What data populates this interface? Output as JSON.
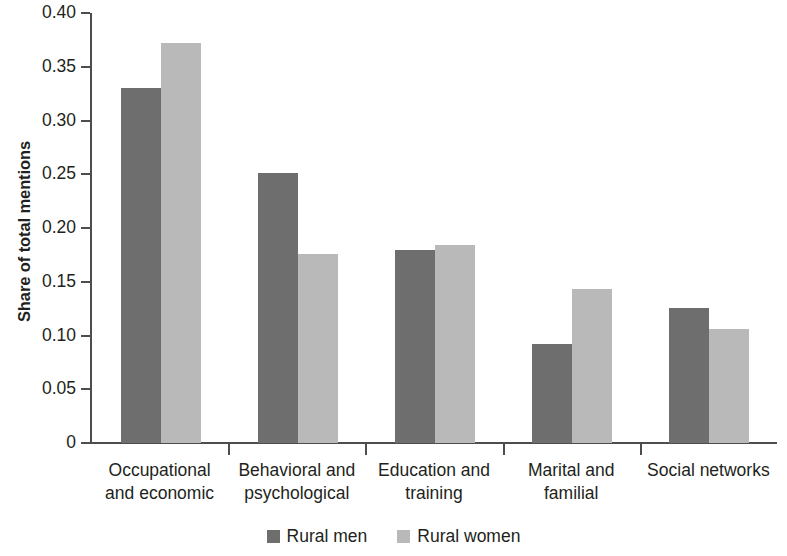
{
  "chart_data": {
    "type": "bar",
    "title": "",
    "xlabel": "",
    "ylabel": "Share of total mentions",
    "ylim": [
      0,
      0.4
    ],
    "grid": false,
    "legend_position": "bottom-center",
    "categories": [
      "Occupational\nand economic",
      "Behavioral and\npsychological",
      "Education and\ntraining",
      "Marital and\nfamilial",
      "Social networks"
    ],
    "y_ticks": [
      "0",
      "0.05",
      "0.10",
      "0.15",
      "0.20",
      "0.25",
      "0.30",
      "0.35",
      "0.40"
    ],
    "y_tick_values": [
      0,
      0.05,
      0.1,
      0.15,
      0.2,
      0.25,
      0.3,
      0.35,
      0.4
    ],
    "series": [
      {
        "name": "Rural men",
        "color": "#6e6e6e",
        "values": [
          0.33,
          0.251,
          0.18,
          0.092,
          0.126
        ]
      },
      {
        "name": "Rural women",
        "color": "#b9b9b9",
        "values": [
          0.372,
          0.176,
          0.184,
          0.143,
          0.106
        ]
      }
    ]
  },
  "legend": {
    "entries": [
      {
        "label": "Rural men",
        "swatch": "men"
      },
      {
        "label": "Rural women",
        "swatch": "women"
      }
    ]
  }
}
